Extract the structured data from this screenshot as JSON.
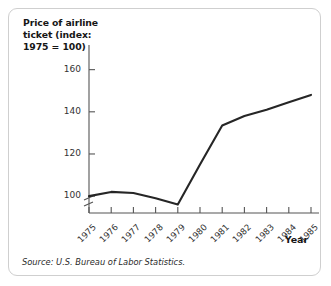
{
  "figure": {
    "source_note": "Source: U.S. Bureau of Labor Statistics.",
    "border_color": "#cfcfcf",
    "background_color": "#ffffff"
  },
  "chart_data": {
    "type": "line",
    "title": "Price of airline ticket (index: 1975 = 100)",
    "title_lines": [
      "Price of airline",
      "ticket (index:",
      "1975 = 100)"
    ],
    "xlabel": "Year",
    "ylabel": "Price of airline ticket (index: 1975 = 100)",
    "categories": [
      "1975",
      "1976",
      "1977",
      "1978",
      "1979",
      "1980",
      "1981",
      "1982",
      "1983",
      "1984",
      "1985"
    ],
    "x": [
      1975,
      1976,
      1977,
      1978,
      1979,
      1980,
      1981,
      1982,
      1983,
      1984,
      1985
    ],
    "values": [
      100,
      102,
      101.5,
      99,
      96,
      115,
      133.5,
      138,
      141,
      144.5,
      148
    ],
    "series": [
      {
        "name": "Price of airline ticket",
        "values": [
          100,
          102,
          101.5,
          99,
          96,
          115,
          133.5,
          138,
          141,
          144.5,
          148
        ],
        "color": "#262626"
      }
    ],
    "yticks": [
      100,
      120,
      140,
      160
    ],
    "ytick_labels": [
      "100",
      "120",
      "140",
      "160"
    ],
    "ylim": [
      92,
      166
    ],
    "xlim": [
      1975,
      1985
    ],
    "grid": false,
    "legend": false,
    "y_axis_break": true,
    "line_color": "#262626",
    "axis_color": "#555555"
  }
}
